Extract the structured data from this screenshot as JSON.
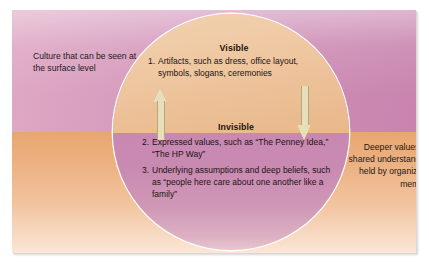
{
  "figure": {
    "type": "iceberg-levels-of-corporate-culture",
    "top_half": {
      "region_label": "Culture that can be seen at the surface level",
      "layer_heading": "Visible",
      "items": [
        {
          "number": "1.",
          "text": "Artifacts, such as dress, office layout, symbols, slogans, ceremonies"
        }
      ]
    },
    "bottom_half": {
      "region_label": "Deeper values and shared understandings held by organization members",
      "layer_heading": "Invisible",
      "items": [
        {
          "number": "2.",
          "text": "Expressed values, such as “The Penney Idea,” “The HP Way”"
        },
        {
          "number": "3.",
          "text": "Underlying assumptions and deep beliefs, such as “people here care about one another like a family”"
        }
      ]
    },
    "arrows": [
      {
        "name": "up-arrow",
        "direction": "up"
      },
      {
        "name": "down-arrow",
        "direction": "down"
      }
    ],
    "colors": {
      "top_background_light": "#dfa9c4",
      "top_background_dark": "#c884ae",
      "bottom_background_dark": "#e8a771",
      "bottom_background_light": "#fbe7d7",
      "circle_top": "#efc9a4",
      "circle_bottom": "#c98ab2",
      "arrow_fill": "#e9debb",
      "arrow_stroke": "#b6a978",
      "text": "#231916"
    }
  }
}
